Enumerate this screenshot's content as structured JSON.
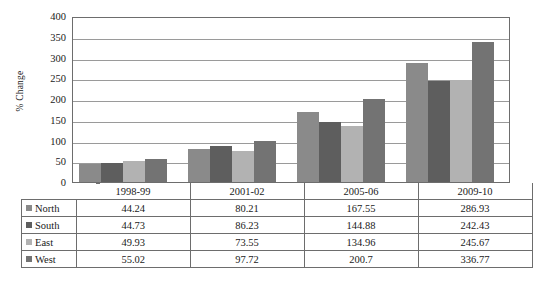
{
  "chart_data": {
    "type": "bar",
    "title": "",
    "xlabel": "",
    "ylabel": "% Change",
    "ylim": [
      0,
      400
    ],
    "ytick_step": 50,
    "yticks": [
      400,
      350,
      300,
      250,
      200,
      150,
      100,
      50,
      0
    ],
    "grid": true,
    "legend_position": "table-left",
    "categories": [
      "1998-99",
      "2001-02",
      "2005-06",
      "2009-10"
    ],
    "series": [
      {
        "name": "North",
        "color": "#8a8a8a",
        "values": [
          44.24,
          80.21,
          167.55,
          286.93
        ]
      },
      {
        "name": "South",
        "color": "#5e5e5e",
        "values": [
          44.73,
          86.23,
          144.88,
          242.43
        ]
      },
      {
        "name": "East",
        "color": "#b2b2b2",
        "values": [
          49.93,
          73.55,
          134.96,
          245.67
        ]
      },
      {
        "name": "West",
        "color": "#737373",
        "values": [
          55.02,
          97.72,
          200.7,
          336.77
        ]
      }
    ],
    "value_labels": [
      [
        "44.24",
        "80.21",
        "167.55",
        "286.93"
      ],
      [
        "44.73",
        "86.23",
        "144.88",
        "242.43"
      ],
      [
        "49.93",
        "73.55",
        "134.96",
        "245.67"
      ],
      [
        "55.02",
        "97.72",
        "200.7",
        "336.77"
      ]
    ]
  },
  "axis": {
    "y_title": "% Change",
    "tick_400": "400",
    "tick_350": "350",
    "tick_300": "300",
    "tick_250": "250",
    "tick_200": "200",
    "tick_150": "150",
    "tick_100": "100",
    "tick_50": "50",
    "tick_0": "0"
  },
  "table": {
    "period_headers": [
      "1998-99",
      "2001-02",
      "2005-06",
      "2009-10"
    ],
    "rows": [
      {
        "series": "North",
        "color": "#8a8a8a",
        "cells": [
          "44.24",
          "80.21",
          "167.55",
          "286.93"
        ]
      },
      {
        "series": "South",
        "color": "#5e5e5e",
        "cells": [
          "44.73",
          "86.23",
          "144.88",
          "242.43"
        ]
      },
      {
        "series": "East",
        "color": "#b2b2b2",
        "cells": [
          "49.93",
          "73.55",
          "134.96",
          "245.67"
        ]
      },
      {
        "series": "West",
        "color": "#737373",
        "cells": [
          "55.02",
          "97.72",
          "200.7",
          "336.77"
        ]
      }
    ]
  },
  "colors": {
    "north": "#8a8a8a",
    "south": "#5e5e5e",
    "east": "#b2b2b2",
    "west": "#737373",
    "gridline": "#9a9a9a",
    "axis_border": "#6d6d6d",
    "background": "#ffffff"
  }
}
